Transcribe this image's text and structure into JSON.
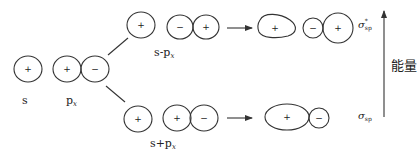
{
  "diagram": {
    "colors": {
      "stroke": "#333333",
      "text": "#222222",
      "background": "#ffffff"
    },
    "atomic_orbitals": {
      "s": {
        "label": "s",
        "sign": "+"
      },
      "px": {
        "label": "p",
        "subscript": "x",
        "signs": [
          "+",
          "−"
        ]
      }
    },
    "combinations": {
      "minus": {
        "label": "s-p",
        "subscript": "x",
        "s_sign": "+",
        "p_signs": [
          "−",
          "+"
        ]
      },
      "plus": {
        "label": "s+p",
        "subscript": "x",
        "s_sign": "+",
        "p_signs": [
          "+",
          "−"
        ]
      }
    },
    "molecular_orbitals": {
      "antibonding": {
        "symbol": "σ",
        "sup": "*",
        "sub": "sp",
        "signs": [
          "+",
          "−",
          "+"
        ]
      },
      "bonding": {
        "symbol": "σ",
        "sub": "sp",
        "signs": [
          "+",
          "−"
        ]
      }
    },
    "energy_axis": {
      "label": "能量",
      "direction": "up"
    }
  }
}
